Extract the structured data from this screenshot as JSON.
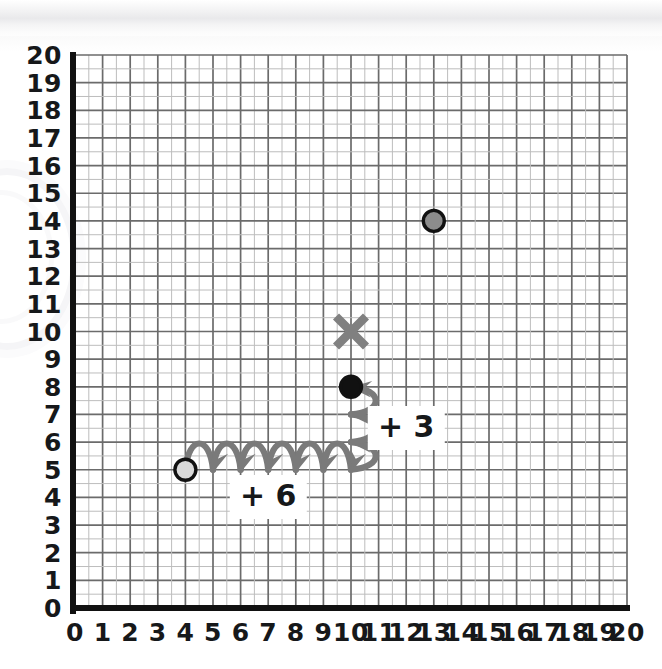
{
  "chart_data": {
    "type": "scatter",
    "title": "",
    "xlabel": "",
    "ylabel": "",
    "xlim": [
      0,
      20
    ],
    "ylim": [
      0,
      20
    ],
    "grid": true,
    "legend": "none",
    "x_ticks": [
      "0",
      "1",
      "2",
      "3",
      "4",
      "5",
      "6",
      "7",
      "8",
      "9",
      "10",
      "11",
      "12",
      "13",
      "14",
      "15",
      "16",
      "17",
      "18",
      "19",
      "20"
    ],
    "y_ticks": [
      "0",
      "1",
      "2",
      "3",
      "4",
      "5",
      "6",
      "7",
      "8",
      "9",
      "10",
      "11",
      "12",
      "13",
      "14",
      "15",
      "16",
      "17",
      "18",
      "19",
      "20"
    ],
    "points": [
      {
        "name": "start-point",
        "x": 4,
        "y": 5,
        "marker": "circle",
        "fill": "#d9d9d9",
        "stroke": "#111111",
        "label": ""
      },
      {
        "name": "end-point",
        "x": 10,
        "y": 8,
        "marker": "circle",
        "fill": "#111111",
        "stroke": "#111111",
        "label": ""
      },
      {
        "name": "cross-point",
        "x": 10,
        "y": 10,
        "marker": "x",
        "fill": "#808080",
        "stroke": "#808080",
        "label": ""
      },
      {
        "name": "gray-point",
        "x": 13,
        "y": 14,
        "marker": "circle",
        "fill": "#8c8c8c",
        "stroke": "#111111",
        "label": ""
      }
    ],
    "jumps": [
      {
        "name": "horizontal-jumps",
        "axis": "x",
        "from": {
          "x": 4,
          "y": 5
        },
        "to": {
          "x": 10,
          "y": 5
        },
        "count": 6,
        "step": 1,
        "label": "+ 6",
        "label_at": {
          "x": 7,
          "y": 4
        },
        "color": "#7a7a7a",
        "direction": "right"
      },
      {
        "name": "vertical-jumps",
        "axis": "y",
        "from": {
          "x": 10,
          "y": 5
        },
        "to": {
          "x": 10,
          "y": 8
        },
        "count": 3,
        "step": 1,
        "label": "+ 3",
        "label_at": {
          "x": 12,
          "y": 6.5
        },
        "color": "#7a7a7a",
        "direction": "up"
      }
    ],
    "annotations": [
      {
        "name": "plus-six-label",
        "text": "+ 6"
      },
      {
        "name": "plus-three-label",
        "text": "+ 3"
      }
    ]
  },
  "colors": {
    "axis": "#111111",
    "grid_major": "#6b6b6b",
    "grid_minor": "#bdbdbd",
    "jump_arc": "#7a7a7a",
    "tick_text": "#16181a",
    "page_bg": "#ffffff"
  }
}
